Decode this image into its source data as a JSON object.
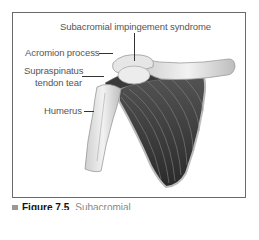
{
  "figure": {
    "labels": {
      "syndrome": "Subacromial impingement syndrome",
      "acromion": "Acromion process",
      "supraspinatus_line1": "Supraspinatus",
      "supraspinatus_line2": "tendon tear",
      "humerus": "Humerus"
    },
    "caption": {
      "figure_number": "Figure 7.5",
      "text": "Subacromial"
    }
  }
}
